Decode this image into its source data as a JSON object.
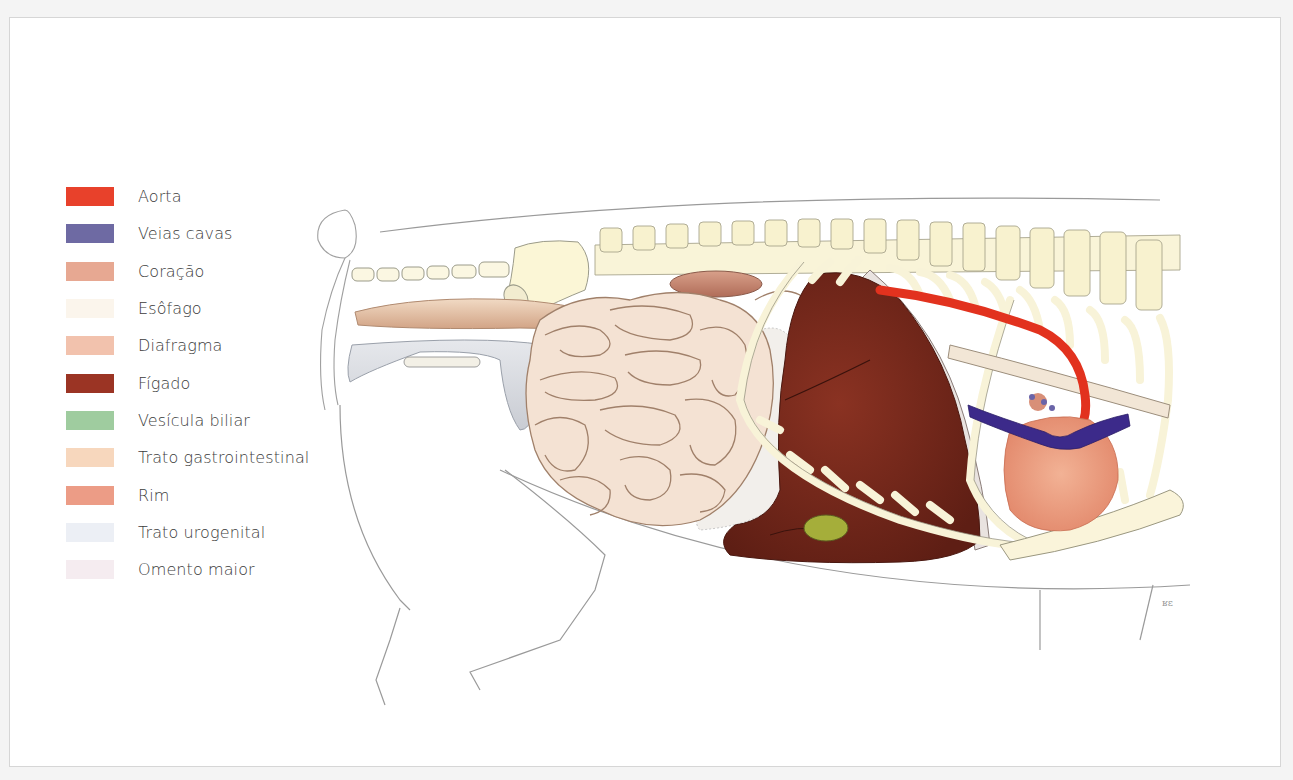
{
  "figure": {
    "legend": [
      {
        "label": "Aorta",
        "color": "#e8412b"
      },
      {
        "label": "Veias cavas",
        "color": "#6e6aa3"
      },
      {
        "label": "Coração",
        "color": "#e7a892"
      },
      {
        "label": "Esôfago",
        "color": "#fbf5ec"
      },
      {
        "label": "Diafragma",
        "color": "#f2c2ad"
      },
      {
        "label": "Fígado",
        "color": "#9b3424"
      },
      {
        "label": "Vesícula biliar",
        "color": "#9fcc9f"
      },
      {
        "label": "Trato gastrointestinal",
        "color": "#f7d7bd"
      },
      {
        "label": "Rim",
        "color": "#ec9c86"
      },
      {
        "label": "Trato urogenital",
        "color": "#eceff5"
      },
      {
        "label": "Omento maior",
        "color": "#f5ecf0"
      }
    ],
    "illustration_colors": {
      "aorta": "#e2321e",
      "vena_cava": "#3c2a8a",
      "heart": "#eea98a",
      "liver": "#7a2a1c",
      "gallbladder": "#a7b23a",
      "intestine": "#f1dccb",
      "kidney": "#c98a74",
      "bone": "#f8f3d8",
      "urogenital": "#d6d9df",
      "omentum": "#f0ece8",
      "outline": "#8a8a8a"
    },
    "signature": "ʁɛ"
  }
}
